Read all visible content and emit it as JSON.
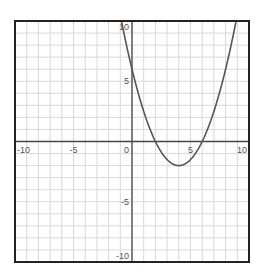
{
  "chart_data": {
    "type": "line",
    "title": "",
    "xlabel": "",
    "ylabel": "",
    "xlim": [
      -10,
      10
    ],
    "ylim": [
      -10,
      10
    ],
    "grid": true,
    "grid_step": 1,
    "x_ticks": [
      -10,
      -5,
      0,
      5,
      10
    ],
    "y_ticks": [
      -10,
      -5,
      5,
      10
    ],
    "x_tick_labels": [
      "-10",
      "-5",
      "0",
      "5",
      "10"
    ],
    "y_tick_labels": [
      "-10",
      "-5",
      "5",
      "10"
    ],
    "legend": null,
    "series": [
      {
        "name": "f(x) = 0.5x^2 - 4x + 6",
        "coefficients": {
          "a": 0.5,
          "b": -4,
          "c": 6
        },
        "vertex": [
          4,
          -2
        ],
        "roots": [
          2,
          6
        ],
        "y_intercept": 6,
        "x": [
          -0.9,
          0,
          1,
          2,
          3,
          4,
          5,
          6,
          7,
          8,
          8.9
        ],
        "y": [
          10,
          6,
          2.5,
          0,
          -1.5,
          -2,
          -1.5,
          0,
          2.5,
          6,
          10
        ]
      }
    ]
  },
  "colors": {
    "frame": "#222222",
    "axes": "#444444",
    "grid": "#d9d9d9",
    "curve": "#555555",
    "labels": "#555555"
  }
}
